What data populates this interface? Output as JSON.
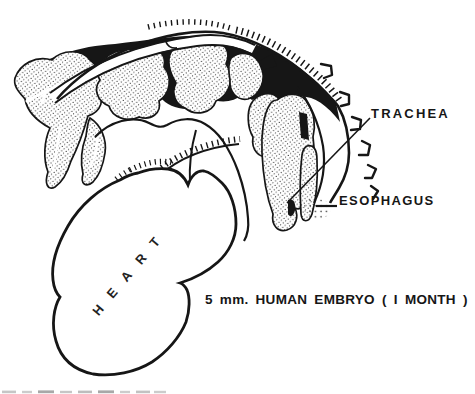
{
  "figure": {
    "caption": "5 mm. HUMAN EMBRYO ( I MONTH )",
    "labels": {
      "trachea": "TRACHEA",
      "esophagus": "ESOPHAGUS",
      "heart": "HEART"
    },
    "colors": {
      "ink": "#161616",
      "paper": "#ffffff"
    }
  }
}
